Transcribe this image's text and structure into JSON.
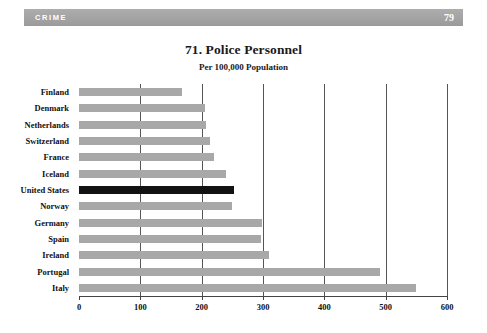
{
  "header": {
    "section": "CRIME",
    "page_number": "79"
  },
  "chart_data": {
    "type": "bar",
    "orientation": "horizontal",
    "title": "71. Police Personnel",
    "subtitle": "Per 100,000 Population",
    "xlabel": "",
    "ylabel": "",
    "xlim": [
      0,
      600
    ],
    "xticks": [
      0,
      100,
      200,
      300,
      400,
      500,
      600
    ],
    "xtick_labels": [
      "0",
      "100",
      "200",
      "300",
      "400",
      "500",
      "600"
    ],
    "grid": true,
    "grid_axis": "x",
    "legend": false,
    "categories": [
      "Finland",
      "Denmark",
      "Netherlands",
      "Switzerland",
      "France",
      "Iceland",
      "United States",
      "Norway",
      "Germany",
      "Spain",
      "Ireland",
      "Portugal",
      "Italy"
    ],
    "values": [
      168,
      205,
      207,
      213,
      220,
      240,
      253,
      250,
      298,
      297,
      310,
      490,
      550
    ],
    "highlight_category": "United States",
    "colors": {
      "bar": "#a8a8a8",
      "highlight_bar": "#121212",
      "header_bar": "#a3a3a3",
      "grid": "#555555",
      "text": "#111111"
    }
  }
}
